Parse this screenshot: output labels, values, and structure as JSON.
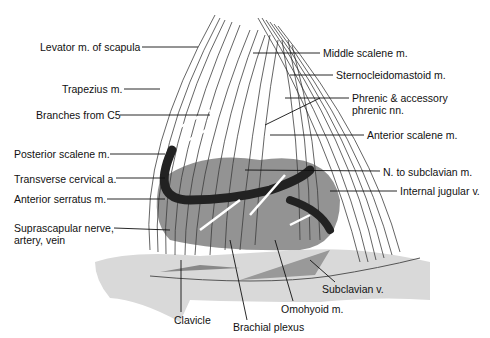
{
  "figure": {
    "labels_left": [
      {
        "id": "levator",
        "text": "Levator m. of scapula",
        "x": 40,
        "y": 41
      },
      {
        "id": "trapezius",
        "text": "Trapezius m.",
        "x": 62,
        "y": 83
      },
      {
        "id": "c5",
        "text": "Branches from C5",
        "x": 36,
        "y": 109
      },
      {
        "id": "posterior-scalene",
        "text": "Posterior scalene m.",
        "x": 14,
        "y": 148
      },
      {
        "id": "transverse-cervical",
        "text": "Transverse cervical a.",
        "x": 14,
        "y": 173
      },
      {
        "id": "anterior-serratus",
        "text": "Anterior serratus m.",
        "x": 14,
        "y": 193
      },
      {
        "id": "suprascapular",
        "text": "Suprascapular nerve,",
        "text2": "artery, vein",
        "x": 14,
        "y": 222
      }
    ],
    "labels_right": [
      {
        "id": "middle-scalene",
        "text": "Middle scalene m.",
        "x": 323,
        "y": 47
      },
      {
        "id": "sternocleidomastoid",
        "text": "Sternocleidomastoid m.",
        "x": 336,
        "y": 69
      },
      {
        "id": "phrenic",
        "text": "Phrenic & accessory",
        "text2": "phrenic nn.",
        "x": 352,
        "y": 92
      },
      {
        "id": "anterior-scalene",
        "text": "Anterior scalene m.",
        "x": 367,
        "y": 129
      },
      {
        "id": "n-subclavian",
        "text": "N. to subclavian m.",
        "x": 383,
        "y": 166
      },
      {
        "id": "internal-jugular",
        "text": "Internal jugular v.",
        "x": 400,
        "y": 185
      }
    ],
    "labels_bottom": [
      {
        "id": "subclavian-v",
        "text": "Subclavian v.",
        "x": 322,
        "y": 283
      },
      {
        "id": "omohyoid",
        "text": "Omohyoid m.",
        "x": 281,
        "y": 303
      },
      {
        "id": "clavicle",
        "text": "Clavicle",
        "x": 174,
        "y": 314
      },
      {
        "id": "brachial-plexus",
        "text": "Brachial plexus",
        "x": 233,
        "y": 321
      }
    ]
  }
}
